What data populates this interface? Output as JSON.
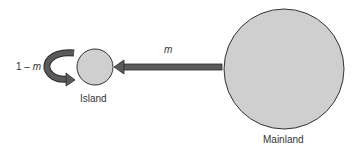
{
  "diagram": {
    "nodes": [
      {
        "id": "island",
        "label": "Island",
        "shape": "circle",
        "fill": "#cfcfcf",
        "stroke": "#333333"
      },
      {
        "id": "mainland",
        "label": "Mainland",
        "shape": "circle",
        "fill": "#cfcfcf",
        "stroke": "#333333"
      }
    ],
    "edges": [
      {
        "from": "mainland",
        "to": "island",
        "label_var": "m",
        "arrow_color": "#555555"
      },
      {
        "from": "island",
        "to": "island",
        "label_prefix": "1 – ",
        "label_var": "m",
        "arrow_color": "#555555"
      }
    ],
    "labels": {
      "island": "Island",
      "mainland": "Mainland",
      "migration_rate": "m",
      "self_recruitment_prefix": "1 – ",
      "self_recruitment_var": "m"
    }
  }
}
